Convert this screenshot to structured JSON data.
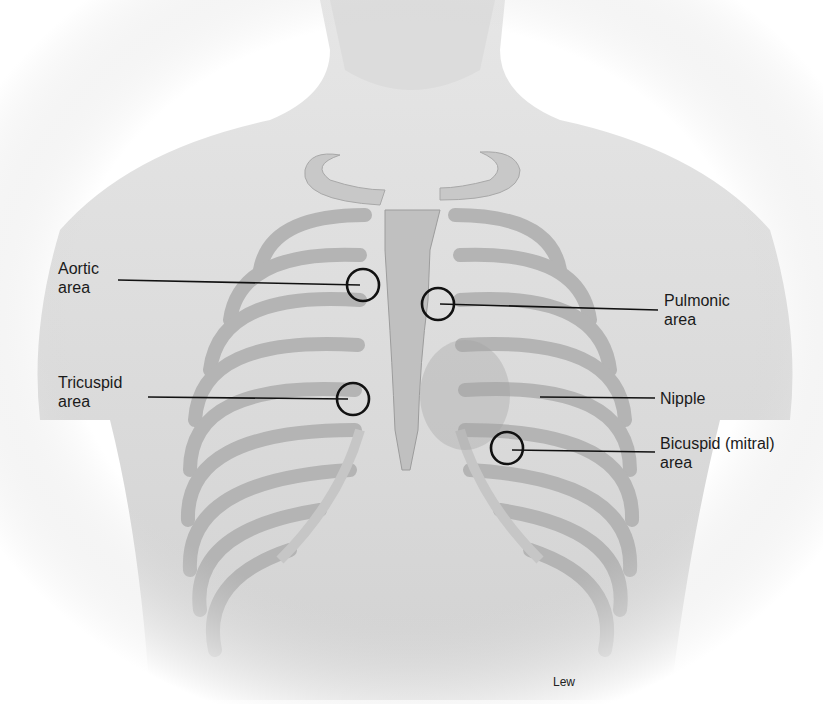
{
  "figure": {
    "labels": [
      {
        "id": "aortic",
        "line1": "Aortic",
        "line2": "area",
        "x": 58,
        "y": 260,
        "circle": [
          363,
          285
        ],
        "line_from": [
          118,
          280
        ]
      },
      {
        "id": "pulmonic",
        "line1": "Pulmonic",
        "line2": "area",
        "x": 664,
        "y": 292,
        "circle": [
          438,
          304
        ],
        "line_from": [
          658,
          308
        ]
      },
      {
        "id": "tricuspid",
        "line1": "Tricuspid",
        "line2": "area",
        "x": 58,
        "y": 374,
        "circle": [
          353,
          399
        ],
        "line_from": [
          148,
          397
        ]
      },
      {
        "id": "nipple",
        "line1": "Nipple",
        "line2": "",
        "x": 660,
        "y": 390,
        "circle": null,
        "line_from": [
          655,
          398
        ]
      },
      {
        "id": "bicuspid",
        "line1": "Bicuspid (mitral)",
        "line2": "area",
        "x": 660,
        "y": 435,
        "circle": [
          507,
          448
        ],
        "line_from": [
          655,
          452
        ]
      }
    ],
    "credit": "Lew"
  }
}
